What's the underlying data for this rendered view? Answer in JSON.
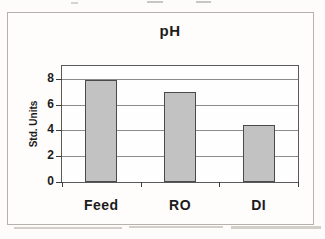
{
  "chart_data": {
    "type": "bar",
    "title": "pH",
    "xlabel": "",
    "ylabel": "Std. Units",
    "categories": [
      "Feed",
      "RO",
      "DI"
    ],
    "values": [
      7.9,
      7.0,
      4.4
    ],
    "ylim": [
      0,
      9
    ],
    "yticks": [
      0,
      2,
      4,
      6,
      8
    ],
    "grid": true,
    "legend": false,
    "colors": {
      "bar_fill": "#c2c2c2",
      "bar_border": "#4a4a4a",
      "gridline": "#8c8c8c",
      "plot_border": "#5a5a5a",
      "axis_tick": "#3d3d3d",
      "text": "#1c1c1c",
      "background": "#fdfcfa"
    }
  }
}
